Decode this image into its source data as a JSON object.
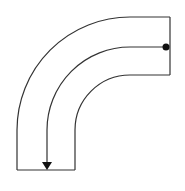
{
  "diagram": {
    "type": "pipe-bend",
    "colors": {
      "stroke": "#333333",
      "background": "#ffffff",
      "marker": "#111111"
    },
    "geometry": {
      "center": [
        130,
        130
      ],
      "outer_radius": 113,
      "centerline_radius": 83,
      "inner_radius": 55,
      "outlet_edge_x": 170,
      "inlet_edge_y": 170
    },
    "streamline": {
      "start_marker": "dot",
      "end_marker": "arrow-down"
    }
  }
}
